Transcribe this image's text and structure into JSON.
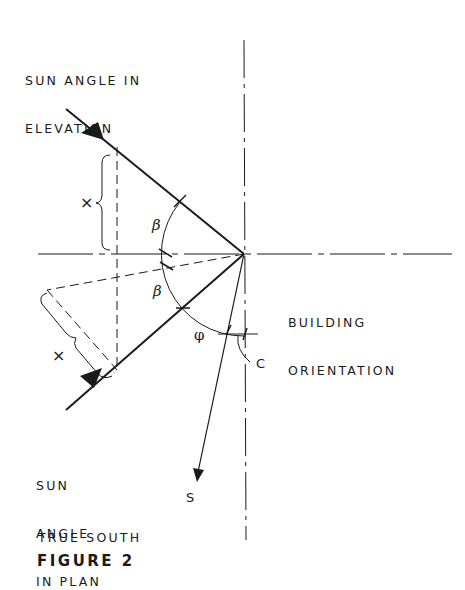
{
  "labels": {
    "elevation_line1": "SUN ANGLE IN",
    "elevation_line2": "ELEVATION",
    "orientation_line1": "BUILDING",
    "orientation_line2": "ORIENTATION",
    "plan_line1": "SUN",
    "plan_line2": "ANGLE",
    "plan_line3": "IN PLAN",
    "true_south": "TRUE SOUTH",
    "figure": "FIGURE 2",
    "s": "S",
    "c": "C",
    "x_upper": "×",
    "x_lower": "×",
    "beta_upper": "β",
    "beta_lower": "β",
    "phi": "φ"
  },
  "colors": {
    "ink": "#1a1a1a",
    "background": "#ffffff"
  }
}
